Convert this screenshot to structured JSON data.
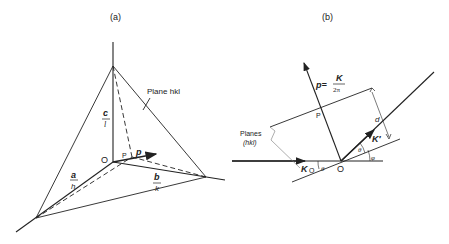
{
  "panel_a": {
    "caption": "(a)",
    "plane_label": "Plane  hkl",
    "vec_c": "c",
    "vec_c_den": "l",
    "vec_a": "a",
    "vec_a_den": "h",
    "vec_b": "b",
    "vec_b_den": "k",
    "origin": "O",
    "point_p": "P",
    "vec_p": "p"
  },
  "panel_b": {
    "caption": "(b)",
    "p_eq": "p=",
    "p_num": "K",
    "p_den": "2π",
    "point_p": "P",
    "planes_label": "Planes",
    "planes_hkl": "(hkl)",
    "d_label": "d",
    "k_prime": "K′",
    "k0": "K",
    "k0_sub": "O",
    "theta1": "θ",
    "theta2": "θ",
    "phi": "φ",
    "origin": "O"
  }
}
